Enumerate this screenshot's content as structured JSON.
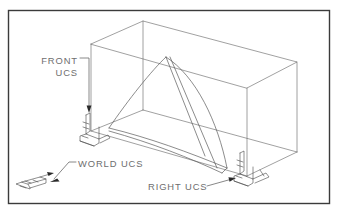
{
  "figure": {
    "type": "technical-line-drawing",
    "border": {
      "present": true,
      "color": "#3b3b3b",
      "x": 8,
      "y": 10,
      "width": 322,
      "height": 194
    },
    "background_color": "#ffffff",
    "line_color": "#6d6d6d",
    "text_color": "#6e6e6e"
  },
  "labels": [
    {
      "id": "front-ucs",
      "line1": "FRONT",
      "line2": "UCS",
      "align": "end",
      "x": 78,
      "y1": 64,
      "y2": 76
    },
    {
      "id": "world-ucs",
      "line1": "WORLD UCS",
      "line2": "",
      "align": "start",
      "x": 78,
      "y1": 167,
      "y2": 0
    },
    {
      "id": "right-ucs",
      "line1": "RIGHT UCS",
      "line2": "",
      "align": "start",
      "x": 148,
      "y1": 190,
      "y2": 0
    }
  ],
  "ucs_icons": [
    {
      "id": "front-ucs-icon",
      "name": "front-ucs-axis-tripod",
      "x": 79,
      "y": 112
    },
    {
      "id": "world-ucs-icon",
      "name": "world-ucs-axis-tripod",
      "x": 20,
      "y": 176
    },
    {
      "id": "right-ucs-icon",
      "name": "right-ucs-axis-tripod",
      "x": 238,
      "y": 150
    }
  ],
  "geometry": {
    "box_description": "isometric rectangular box wireframe",
    "surface_description": "curved tent-like lofted surface inside box"
  }
}
